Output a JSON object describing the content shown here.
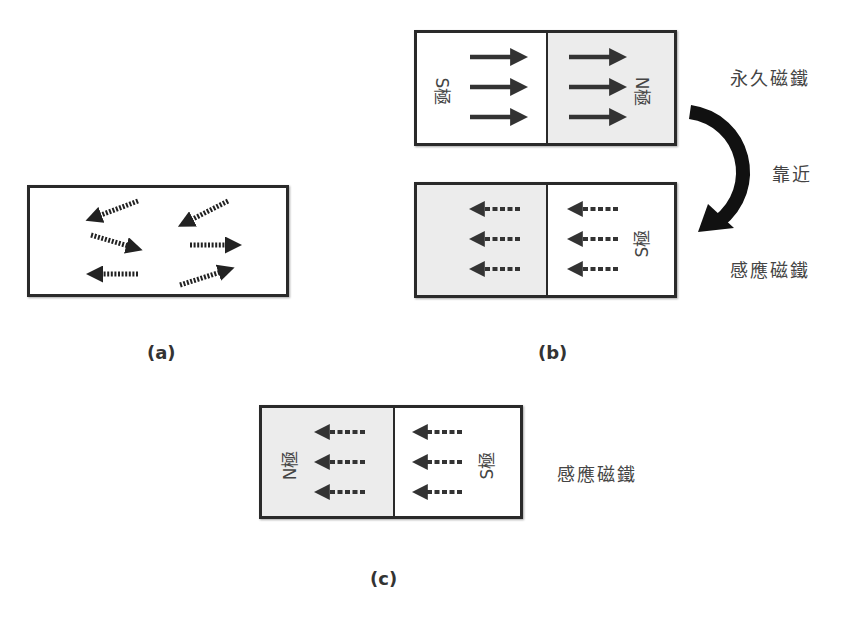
{
  "figure_a": {
    "caption": "(a)",
    "domain_arrows": [
      {
        "dir": "left-down"
      },
      {
        "dir": "left-down"
      },
      {
        "dir": "right-down"
      },
      {
        "dir": "right"
      },
      {
        "dir": "left"
      },
      {
        "dir": "right-up"
      }
    ]
  },
  "figure_b": {
    "caption": "(b)",
    "permanent_magnet": {
      "label": "永久磁鐵",
      "left_pole": "S極",
      "right_pole": "N極",
      "arrow_direction": "right"
    },
    "approach_label": "靠近",
    "induced_magnet": {
      "label": "感應磁鐵",
      "right_pole": "S極",
      "arrow_direction": "left"
    }
  },
  "figure_c": {
    "caption": "(c)",
    "induced_magnet": {
      "label": "感應磁鐵",
      "left_pole": "N極",
      "right_pole": "S極",
      "arrow_direction": "left"
    }
  },
  "colors": {
    "outline": "#2a2a2a",
    "shaded_half": "#ececec",
    "arrow": "#333333"
  }
}
